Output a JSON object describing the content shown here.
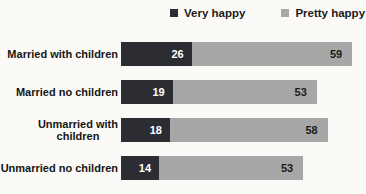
{
  "chart_data": {
    "type": "bar",
    "orientation": "horizontal",
    "stacked": true,
    "title": "",
    "xlabel": "",
    "ylabel": "",
    "grid": false,
    "legend_position": "top",
    "categories": [
      "Married with children",
      "Married no children",
      "Unmarried with children",
      "Unmarried no children"
    ],
    "category_display_lines": [
      [
        "Married with children"
      ],
      [
        "Married no children"
      ],
      [
        "Unmarried with",
        "children"
      ],
      [
        "Unmarried no children"
      ]
    ],
    "series": [
      {
        "name": "Very happy",
        "values": [
          26,
          19,
          18,
          14
        ],
        "color": "#2c2c33",
        "label_color": "#ffffff"
      },
      {
        "name": "Pretty happy",
        "values": [
          59,
          53,
          58,
          53
        ],
        "color": "#a7a7a7",
        "label_color": "#1a1a1a"
      }
    ],
    "value_labels_shown": true,
    "xlim": [
      0,
      90
    ]
  },
  "style": {
    "background": "#fbfaf7",
    "legend_text_color": "#1c1c1c",
    "category_text_color": "#161616"
  }
}
